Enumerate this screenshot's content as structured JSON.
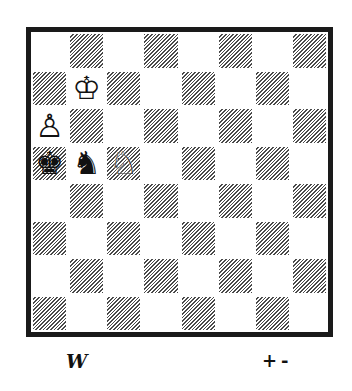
{
  "diagram": {
    "type": "chess-position",
    "board": {
      "files": [
        "a",
        "b",
        "c",
        "d",
        "e",
        "f",
        "g",
        "h"
      ],
      "ranks": [
        8,
        7,
        6,
        5,
        4,
        3,
        2,
        1
      ],
      "light_color": "#ffffff",
      "dark_color": "#4a4a4a",
      "dark_style": "diagonal-hatch",
      "border_color": "#1a1a1a"
    },
    "pieces": [
      {
        "square": "b7",
        "color": "white",
        "type": "king",
        "glyph": "♔"
      },
      {
        "square": "a6",
        "color": "white",
        "type": "pawn",
        "glyph": "♙"
      },
      {
        "square": "c5",
        "color": "white",
        "type": "knight",
        "glyph": "♘"
      },
      {
        "square": "a5",
        "color": "black",
        "type": "king",
        "glyph": "♚"
      },
      {
        "square": "b5",
        "color": "black",
        "type": "knight",
        "glyph": "♞"
      }
    ],
    "side_to_move": "W",
    "evaluation": "+-"
  }
}
